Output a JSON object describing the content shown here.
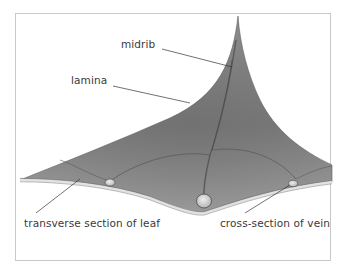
{
  "figure": {
    "type": "botanical-illustration",
    "colors": {
      "frame": "#c9c9c9",
      "leaf_light": "#a9a9a9",
      "leaf_mid": "#8a8a8a",
      "leaf_dark": "#5d5d5d",
      "vein_section": "#d8d8d8",
      "leader_line": "#333333",
      "label_text": "#3a3a3a"
    }
  },
  "labels": {
    "midrib": "midrib",
    "lamina": "lamina",
    "transverse_section": "transverse section of leaf",
    "cross_section_vein": "cross-section of vein"
  }
}
